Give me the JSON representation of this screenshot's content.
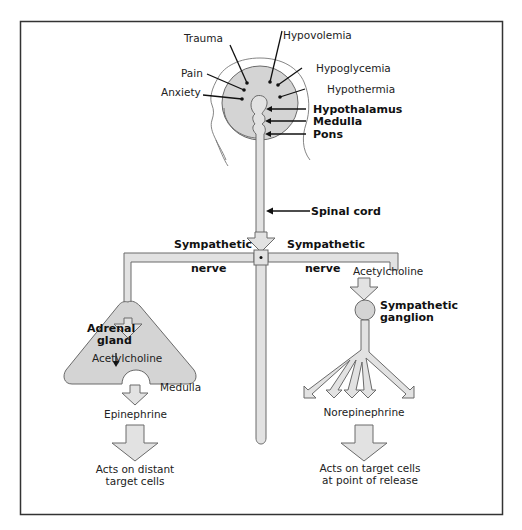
{
  "figure": {
    "brain_regions": {
      "hypothalamus": "Hypothalamus",
      "medulla": "Medulla",
      "pons": "Pons"
    },
    "stimuli": {
      "trauma": "Trauma",
      "hypovolemia": "Hypovolemia",
      "hypoglycemia": "Hypoglycemia",
      "hypothermia": "Hypothermia",
      "pain": "Pain",
      "anxiety": "Anxiety"
    },
    "spinal_cord": "Spinal cord",
    "left_branch": {
      "nerve_label_top": "Sympathetic",
      "nerve_label_bottom": "nerve",
      "organ_line1": "Adrenal",
      "organ_line2": "gland",
      "transmitter": "Acetylcholine",
      "region": "Medulla",
      "hormone": "Epinephrine",
      "effect_line1": "Acts on distant",
      "effect_line2": "target cells"
    },
    "right_branch": {
      "nerve_label_top": "Sympathetic",
      "nerve_label_bottom": "nerve",
      "transmitter": "Acetylcholine",
      "ganglion_line1": "Sympathetic",
      "ganglion_line2": "ganglion",
      "hormone": "Norepinephrine",
      "effect_line1": "Acts on target cells",
      "effect_line2": "at point of release"
    },
    "colors": {
      "structure_fill": "#d4d4d4",
      "outline": "#6a6a6a",
      "text": "#222222",
      "frame": "#333333"
    }
  }
}
